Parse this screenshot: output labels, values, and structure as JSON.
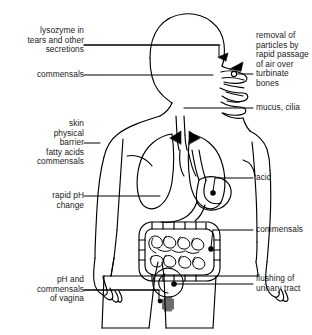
{
  "diagram": {
    "stroke_color": "#000000",
    "text_color": "#1a1a1a",
    "background_color": "#ffffff"
  },
  "labels_left": [
    {
      "name": "label-lysozyme",
      "text": "lysozyme in\ntears and other\nsecretions",
      "align": "right"
    },
    {
      "name": "label-commensals-upper",
      "text": "commensals",
      "align": "right"
    },
    {
      "name": "label-skin",
      "text": "skin\nphysical\nbarrier\nfatty acids\ncommensals",
      "align": "right"
    },
    {
      "name": "label-rapid-ph-change",
      "text": "rapid pH\nchange",
      "align": "right"
    },
    {
      "name": "label-ph-vagina",
      "text": "pH and\ncommensals\nof vagina",
      "align": "right"
    }
  ],
  "labels_right": [
    {
      "name": "label-removal-particles",
      "text": "removal of\nparticles by\nrapid passage\nof air over\nturbinate\nbones",
      "align": "left"
    },
    {
      "name": "label-mucus-cilia",
      "text": "mucus, cilia",
      "align": "left"
    },
    {
      "name": "label-acid",
      "text": "acid",
      "align": "left"
    },
    {
      "name": "label-commensals-gut",
      "text": "commensals",
      "align": "left"
    },
    {
      "name": "label-flushing-urinary",
      "text": "flushing of\nurinary tract",
      "align": "left"
    }
  ]
}
